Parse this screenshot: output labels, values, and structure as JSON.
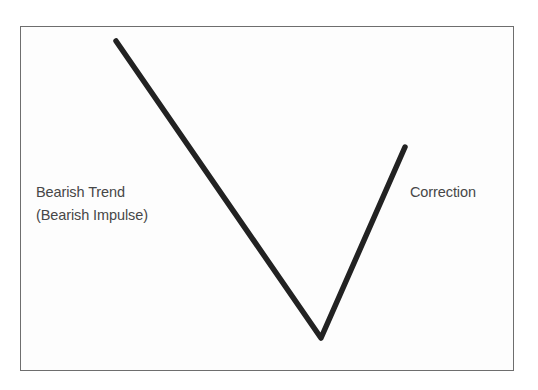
{
  "diagram": {
    "labels": {
      "left_line1": "Bearish Trend",
      "left_line2": "(Bearish Impulse)",
      "right": "Correction"
    },
    "line_color": "#222222",
    "border_color": "#6e6e6e",
    "text_color": "#474747",
    "points": {
      "start": [
        116,
        41
      ],
      "bottom": [
        321,
        338
      ],
      "end": [
        405,
        147
      ]
    }
  }
}
